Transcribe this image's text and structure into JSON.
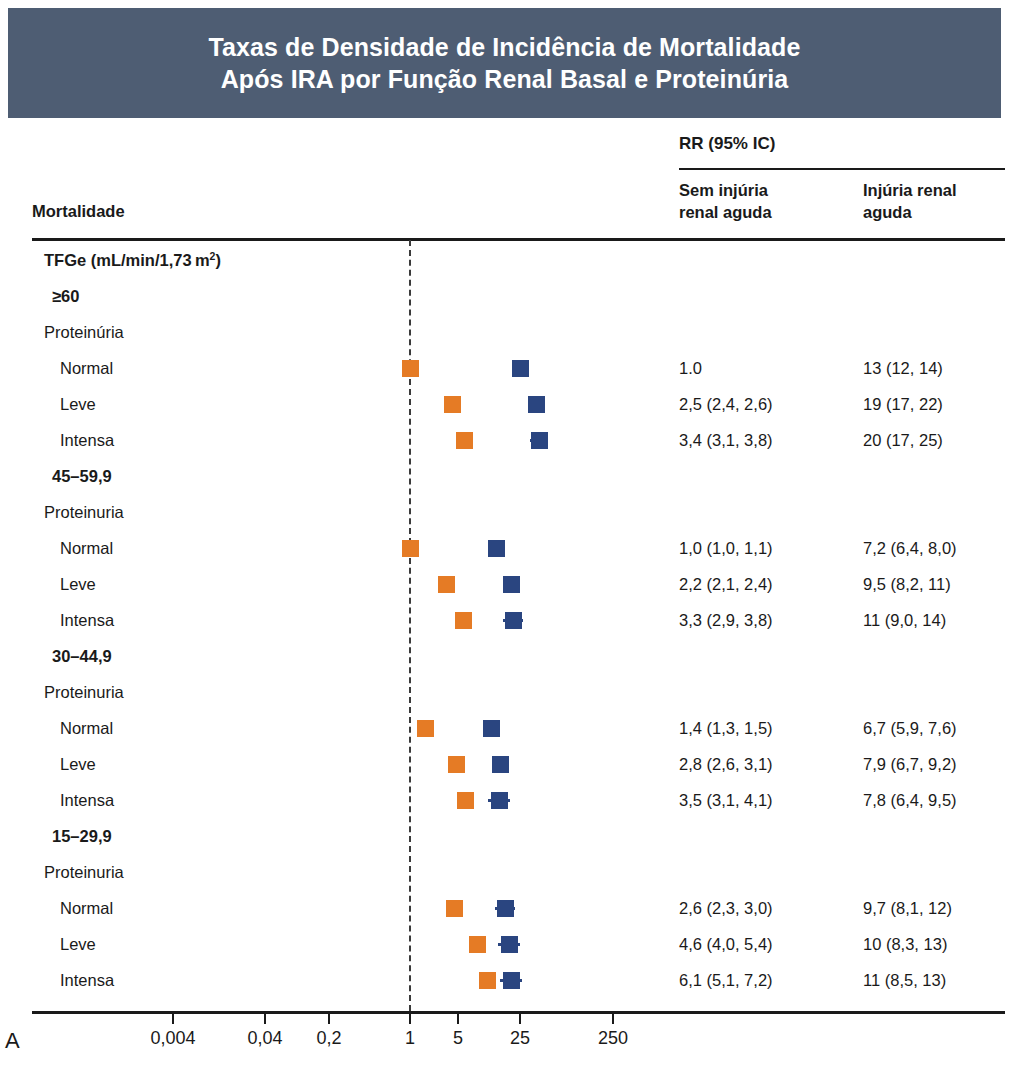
{
  "title": {
    "line1": "Taxas de Densidade de Incidência de Mortalidade",
    "line2": "Após IRA por Função Renal Basal e Proteinúria",
    "banner_color": "#4e5d73"
  },
  "header": {
    "rr_group": "RR (95% IC)",
    "col1": "Sem injúria\nrenal aguda",
    "col1_l1": "Sem injúria",
    "col1_l2": "renal aguda",
    "col2_l1": "Injúria renal",
    "col2_l2": "aguda",
    "row_header": "Mortalidade"
  },
  "panel_letter": "A",
  "colors": {
    "no_aki_marker": "#e57b25",
    "aki_marker": "#2a4580",
    "refline": "#3a3a3a",
    "rule": "#1a1a1a"
  },
  "axis": {
    "tick_labels": [
      "0,004",
      "0,04",
      "0,2",
      "1",
      "5",
      "25",
      "250"
    ],
    "tick_values": [
      0.004,
      0.04,
      0.2,
      1,
      5,
      25,
      250
    ],
    "tick_x": [
      173,
      265,
      329,
      410,
      458,
      520,
      613
    ],
    "scale": "log"
  },
  "chart_data": {
    "type": "scatter",
    "title": "Taxas de Densidade de Incidência de Mortalidade Após IRA por Função Renal Basal e Proteinúria",
    "xlabel": "RR (95% IC)",
    "ylabel": "Mortalidade",
    "xscale": "log",
    "xticks": [
      0.004,
      0.04,
      0.2,
      1,
      5,
      25,
      250
    ],
    "xticklabels": [
      "0,004",
      "0,04",
      "0,2",
      "1",
      "5",
      "25",
      "250"
    ],
    "reference_line": 1,
    "grid": false,
    "legend": [
      "Sem injúria renal aguda",
      "Injúria renal aguda"
    ],
    "series": [
      {
        "name": "Sem injúria renal aguda",
        "color": "#e57b25"
      },
      {
        "name": "Injúria renal aguda",
        "color": "#2a4580"
      }
    ],
    "rows": [
      {
        "label": "TFGe (mL/min/1,73 m²)",
        "level": 0,
        "type": "group"
      },
      {
        "label": "≥60",
        "level": 1,
        "type": "group"
      },
      {
        "label": "Proteinúria",
        "level": 2,
        "type": "subgroup"
      },
      {
        "label": "Normal",
        "level": 3,
        "type": "data",
        "no_aki": "1.0",
        "aki": "13 (12, 14)",
        "no_aki_x": 410,
        "aki_x": 520,
        "no_aki_w": 0,
        "aki_w": 0
      },
      {
        "label": "Leve",
        "level": 3,
        "type": "data",
        "no_aki": "2,5 (2,4, 2,6)",
        "aki": "19 (17, 22)",
        "no_aki_x": 452,
        "aki_x": 536,
        "no_aki_w": 0,
        "aki_w": 0
      },
      {
        "label": "Intensa",
        "level": 3,
        "type": "data",
        "no_aki": "3,4 (3,1, 3,8)",
        "aki": "20 (17, 25)",
        "no_aki_x": 464,
        "aki_x": 539,
        "no_aki_w": 0,
        "aki_w": 18
      },
      {
        "label": "45–59,9",
        "level": 1,
        "type": "group"
      },
      {
        "label": "Proteinuria",
        "level": 2,
        "type": "subgroup"
      },
      {
        "label": "Normal",
        "level": 3,
        "type": "data",
        "no_aki": "1,0 (1,0, 1,1)",
        "aki": "7,2 (6,4, 8,0)",
        "no_aki_x": 410,
        "aki_x": 496,
        "no_aki_w": 0,
        "aki_w": 0
      },
      {
        "label": "Leve",
        "level": 3,
        "type": "data",
        "no_aki": "2,2 (2,1, 2,4)",
        "aki": "9,5 (8,2, 11)",
        "no_aki_x": 446,
        "aki_x": 511,
        "no_aki_w": 0,
        "aki_w": 16
      },
      {
        "label": "Intensa",
        "level": 3,
        "type": "data",
        "no_aki": "3,3 (2,9, 3,8)",
        "aki": "11 (9,0, 14)",
        "no_aki_x": 463,
        "aki_x": 513,
        "no_aki_w": 0,
        "aki_w": 20
      },
      {
        "label": "30–44,9",
        "level": 1,
        "type": "group"
      },
      {
        "label": "Proteinuria",
        "level": 2,
        "type": "subgroup"
      },
      {
        "label": "Normal",
        "level": 3,
        "type": "data",
        "no_aki": "1,4 (1,3, 1,5)",
        "aki": "6,7 (5,9, 7,6)",
        "no_aki_x": 425,
        "aki_x": 491,
        "no_aki_w": 0,
        "aki_w": 0
      },
      {
        "label": "Leve",
        "level": 3,
        "type": "data",
        "no_aki": "2,8 (2,6, 3,1)",
        "aki": "7,9 (6,7, 9,2)",
        "no_aki_x": 456,
        "aki_x": 500,
        "no_aki_w": 0,
        "aki_w": 16
      },
      {
        "label": "Intensa",
        "level": 3,
        "type": "data",
        "no_aki": "3,5 (3,1, 4,1)",
        "aki": "7,8 (6,4, 9,5)",
        "no_aki_x": 465,
        "aki_x": 499,
        "no_aki_w": 0,
        "aki_w": 22
      },
      {
        "label": "15–29,9",
        "level": 1,
        "type": "group"
      },
      {
        "label": "Proteinuria",
        "level": 2,
        "type": "subgroup"
      },
      {
        "label": "Normal",
        "level": 3,
        "type": "data",
        "no_aki": "2,6 (2,3, 3,0)",
        "aki": "9,7 (8,1, 12)",
        "no_aki_x": 454,
        "aki_x": 505,
        "no_aki_w": 0,
        "aki_w": 20
      },
      {
        "label": "Leve",
        "level": 3,
        "type": "data",
        "no_aki": "4,6 (4,0, 5,4)",
        "aki": "10 (8,3, 13)",
        "no_aki_x": 477,
        "aki_x": 509,
        "no_aki_w": 0,
        "aki_w": 22
      },
      {
        "label": "Intensa",
        "level": 3,
        "type": "data",
        "no_aki": "6,1 (5,1, 7,2)",
        "aki": "11 (8,5, 13)",
        "no_aki_x": 487,
        "aki_x": 511,
        "no_aki_w": 14,
        "aki_w": 22
      }
    ]
  }
}
